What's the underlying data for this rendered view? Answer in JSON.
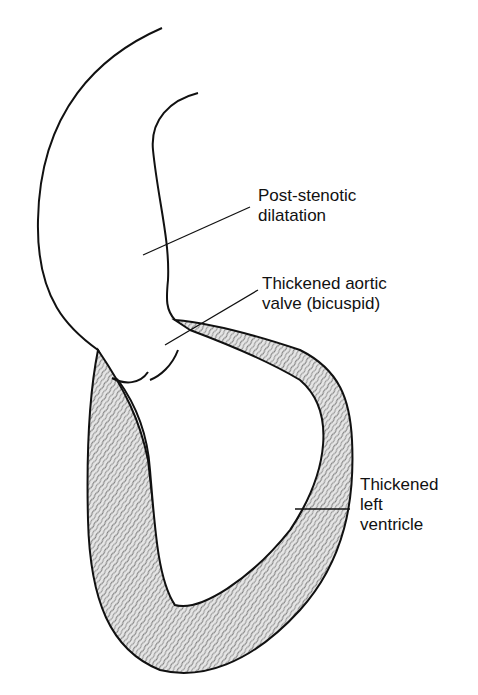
{
  "diagram": {
    "colors": {
      "outline": "#111111",
      "muscle_fill": "#cfcfcf",
      "background": "#ffffff"
    },
    "labels": [
      {
        "id": "post-stenotic",
        "lines": [
          "Post-stenotic",
          "dilatation"
        ]
      },
      {
        "id": "aortic-valve",
        "lines": [
          "Thickened aortic",
          "valve (bicuspid)"
        ]
      },
      {
        "id": "left-ventricle",
        "lines": [
          "Thickened",
          "left",
          "ventricle"
        ]
      }
    ]
  }
}
